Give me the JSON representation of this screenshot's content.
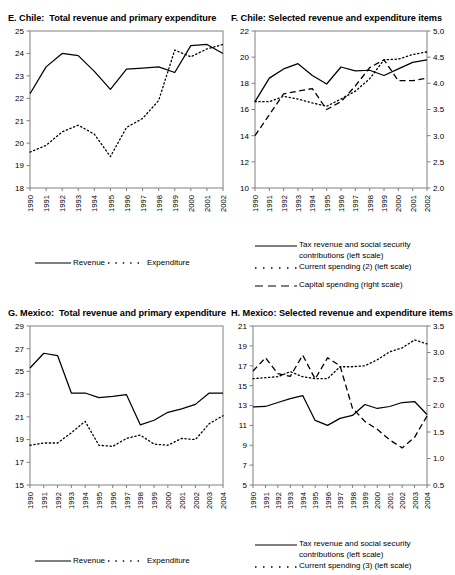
{
  "figure": {
    "panel_count": 4,
    "background": "#ffffff",
    "line_color": "#000000"
  },
  "panels": {
    "e": {
      "title": "E. Chile:  Total revenue and primary expenditure",
      "legend": {
        "revenue": "Revenue",
        "expenditure": "Expenditure"
      }
    },
    "f": {
      "title": "F. Chile: Selected revenue and expenditure items",
      "legend": {
        "tax_line1": "Tax revenue and social security",
        "tax_line2": "contributions (left scale)",
        "current": "Current spending (2) (left scale)",
        "capital": "Capital spending (right scale)"
      }
    },
    "g": {
      "title": "G. Mexico:  Total revenue and primary expenditure",
      "legend": {
        "revenue": "Revenue",
        "expenditure": "Expenditure"
      }
    },
    "h": {
      "title": "H. Mexico: Selected revenue and expenditure items",
      "legend": {
        "tax_line1": "Tax revenue and social security",
        "tax_line2": "contributions (left scale)",
        "current": "Current spending (3) (left scale)"
      }
    }
  },
  "chart_data": [
    {
      "id": "E",
      "type": "line",
      "title": "E. Chile:  Total revenue and primary expenditure",
      "xlabel": "",
      "ylabel": "",
      "grid": false,
      "legend_position": "bottom",
      "categories": [
        "1990",
        "1991",
        "1992",
        "1993",
        "1994",
        "1995",
        "1996",
        "1997",
        "1998",
        "1999",
        "2000",
        "2001",
        "2002"
      ],
      "ylim": [
        18,
        25
      ],
      "yticks": [
        18,
        19,
        20,
        21,
        22,
        23,
        24,
        25
      ],
      "series": [
        {
          "name": "Revenue",
          "style": "solid",
          "axis": "left",
          "values": [
            22.2,
            23.4,
            24.0,
            23.9,
            23.2,
            22.4,
            23.3,
            23.35,
            23.4,
            23.15,
            24.35,
            24.4,
            24.0
          ]
        },
        {
          "name": "Expenditure",
          "style": "dotted",
          "axis": "left",
          "values": [
            19.6,
            19.9,
            20.5,
            20.8,
            20.4,
            19.4,
            20.7,
            21.1,
            21.9,
            24.15,
            23.85,
            24.2,
            24.4
          ]
        }
      ]
    },
    {
      "id": "F",
      "type": "line",
      "title": "F. Chile: Selected revenue and expenditure items",
      "xlabel": "",
      "ylabel": "",
      "grid": false,
      "legend_position": "bottom",
      "categories": [
        "1990",
        "1991",
        "1992",
        "1993",
        "1994",
        "1995",
        "1996",
        "1997",
        "1998",
        "1999",
        "2000",
        "2001",
        "2002"
      ],
      "ylim": [
        10,
        22
      ],
      "yticks": [
        10,
        12,
        14,
        16,
        18,
        20,
        22
      ],
      "ylim_right": [
        2.0,
        5.0
      ],
      "yticks_right": [
        "2.0",
        "2.5",
        "3.0",
        "3.5",
        "4.0",
        "4.5",
        "5.0"
      ],
      "series": [
        {
          "name": "Tax revenue and social security contributions (left scale)",
          "style": "solid",
          "axis": "left",
          "values": [
            16.6,
            18.4,
            19.1,
            19.5,
            18.6,
            17.95,
            19.25,
            18.95,
            19.0,
            18.6,
            19.1,
            19.6,
            19.8
          ]
        },
        {
          "name": "Current spending (2) (left scale)",
          "style": "dotted",
          "axis": "left",
          "values": [
            16.6,
            16.6,
            17.0,
            16.8,
            16.5,
            16.25,
            16.8,
            17.4,
            18.35,
            19.8,
            19.85,
            20.2,
            20.4
          ]
        },
        {
          "name": "Capital spending (right scale)",
          "style": "dashed",
          "axis": "right",
          "values": [
            3.0,
            3.4,
            3.8,
            3.85,
            3.9,
            3.5,
            3.65,
            3.95,
            4.3,
            4.45,
            4.05,
            4.05,
            4.1
          ]
        }
      ]
    },
    {
      "id": "G",
      "type": "line",
      "title": "G. Mexico:  Total revenue and primary expenditure",
      "xlabel": "",
      "ylabel": "",
      "grid": false,
      "legend_position": "bottom",
      "categories": [
        "1990",
        "1991",
        "1992",
        "1993",
        "1994",
        "1995",
        "1996",
        "1997",
        "1998",
        "1999",
        "2000",
        "2001",
        "2002",
        "2003",
        "2004"
      ],
      "ylim": [
        15,
        29
      ],
      "yticks": [
        15,
        17,
        19,
        21,
        23,
        25,
        27,
        29
      ],
      "series": [
        {
          "name": "Revenue",
          "style": "solid",
          "axis": "left",
          "values": [
            25.3,
            26.6,
            26.4,
            23.1,
            23.1,
            22.7,
            22.8,
            22.95,
            20.3,
            20.7,
            21.4,
            21.7,
            22.1,
            23.1,
            23.1
          ]
        },
        {
          "name": "Expenditure",
          "style": "dotted",
          "axis": "left",
          "values": [
            18.5,
            18.7,
            18.7,
            19.6,
            20.6,
            18.5,
            18.4,
            19.1,
            19.4,
            18.6,
            18.5,
            19.1,
            19.0,
            20.4,
            21.1,
            20.7
          ]
        }
      ]
    },
    {
      "id": "H",
      "type": "line",
      "title": "H. Mexico: Selected revenue and expenditure items",
      "xlabel": "",
      "ylabel": "",
      "grid": false,
      "legend_position": "bottom",
      "categories": [
        "1990",
        "1991",
        "1992",
        "1993",
        "1994",
        "1995",
        "1996",
        "1997",
        "1998",
        "1999",
        "2000",
        "2001",
        "2002",
        "2003",
        "2004"
      ],
      "ylim": [
        5,
        21
      ],
      "yticks": [
        5,
        7,
        9,
        11,
        13,
        15,
        17,
        19,
        21
      ],
      "ylim_right": [
        0.5,
        3.5
      ],
      "yticks_right": [
        "0.5",
        "1.0",
        "1.5",
        "2.0",
        "2.5",
        "3.0",
        "3.5"
      ],
      "series": [
        {
          "name": "Tax revenue and social security contributions (left scale)",
          "style": "solid",
          "axis": "left",
          "values": [
            12.85,
            12.9,
            13.3,
            13.7,
            14.0,
            11.5,
            11.0,
            11.7,
            12.0,
            13.1,
            12.7,
            12.9,
            13.3,
            13.4,
            12.1
          ]
        },
        {
          "name": "Current spending (3) (left scale)",
          "style": "dotted",
          "axis": "left",
          "values": [
            15.7,
            15.8,
            15.9,
            16.4,
            15.9,
            15.7,
            15.7,
            16.9,
            16.9,
            17.0,
            17.6,
            18.4,
            18.8,
            19.6,
            19.2
          ]
        },
        {
          "name": "Capital spending",
          "style": "dashed",
          "axis": "right",
          "values": [
            2.65,
            2.9,
            2.6,
            2.55,
            2.95,
            2.5,
            2.9,
            2.75,
            1.95,
            1.7,
            1.55,
            1.35,
            1.2,
            1.4,
            1.8
          ]
        }
      ]
    }
  ]
}
